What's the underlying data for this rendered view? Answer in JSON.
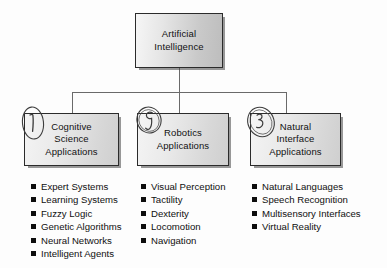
{
  "diagram": {
    "root": {
      "label": "Artificial\nIntelligence",
      "line1": "Artificial",
      "line2": "Intelligence"
    },
    "branches": [
      {
        "annotation": "1",
        "annotation_icon": "circled-handwritten-one",
        "line1": "Cognitive",
        "line2": "Science",
        "line3": "Applications",
        "items": [
          "Expert Systems",
          "Learning Systems",
          "Fuzzy Logic",
          "Genetic Algorithms",
          "Neural Networks",
          "Intelligent Agents"
        ]
      },
      {
        "annotation": "2",
        "annotation_icon": "circled-handwritten-two",
        "line1": "Robotics",
        "line2": "Applications",
        "line3": "",
        "items": [
          "Visual Perception",
          "Tactility",
          "Dexterity",
          "Locomotion",
          "Navigation"
        ]
      },
      {
        "annotation": "3",
        "annotation_icon": "circled-handwritten-three",
        "line1": "Natural",
        "line2": "Interface",
        "line3": "Applications",
        "items": [
          "Natural Languages",
          "Speech Recognition",
          "Multisensory Interfaces",
          "Virtual Reality"
        ]
      }
    ],
    "colors": {
      "background": "#fdfdfd",
      "box_border": "#2b2b2b",
      "box_fill_light": "#f4f4f4",
      "box_fill_dark": "#cfcfcf",
      "shadow": "#464646",
      "connector": "#555555",
      "text": "#111111",
      "bullet": "#0d0d0d",
      "annotation_ink": "#3a3a3a"
    }
  }
}
